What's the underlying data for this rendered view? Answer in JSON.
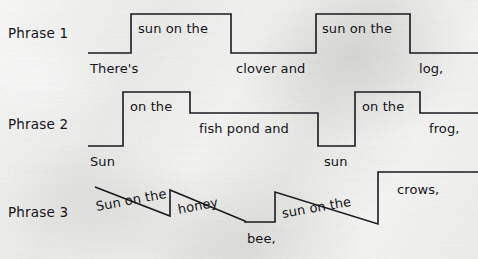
{
  "figure": {
    "type": "prosody-contour-diagram",
    "background_color": "#efefed",
    "line_color": "#1b1b20",
    "text_color": "#15151a"
  },
  "rows": [
    {
      "id": "phrase-1",
      "label": "Phrase 1",
      "label_x": 8,
      "label_y": 27,
      "contour": "M88,53 L131,53 L131,14 L231,14 L231,53 L316,53 L316,14 L410,14 L410,53 L478,53",
      "words": [
        {
          "text": "There's",
          "x": 90,
          "y": 62,
          "tilt": 0
        },
        {
          "text": "sun on the",
          "x": 138,
          "y": 22,
          "tilt": 0
        },
        {
          "text": "clover and",
          "x": 236,
          "y": 62,
          "tilt": 0
        },
        {
          "text": "sun on the",
          "x": 322,
          "y": 22,
          "tilt": 0
        },
        {
          "text": "log,",
          "x": 419,
          "y": 62,
          "tilt": 0
        }
      ]
    },
    {
      "id": "phrase-2",
      "label": "Phrase 2",
      "label_x": 8,
      "label_y": 118,
      "contour": "M88,146 L123,146 L123,92 L190,92 L190,113 L318,113 L318,146 L355,146 L355,92 L420,92 L420,113 L478,113",
      "words": [
        {
          "text": "Sun",
          "x": 90,
          "y": 155,
          "tilt": 0
        },
        {
          "text": "on the",
          "x": 130,
          "y": 100,
          "tilt": 0
        },
        {
          "text": "fish pond and",
          "x": 199,
          "y": 122,
          "tilt": 0
        },
        {
          "text": "sun",
          "x": 324,
          "y": 155,
          "tilt": 0
        },
        {
          "text": "on the",
          "x": 362,
          "y": 100,
          "tilt": 0
        },
        {
          "text": "frog,",
          "x": 429,
          "y": 122,
          "tilt": 0
        }
      ]
    },
    {
      "id": "phrase-3",
      "label": "Phrase 3",
      "label_x": 8,
      "label_y": 206,
      "contour": "M95,187 L170,216 L170,190 L245,221 L245,222 L275,222 L275,192 L378,224 L378,172 L478,172",
      "words": [
        {
          "text": "Sun on the",
          "x": 96,
          "y": 200,
          "tilt": -10.5
        },
        {
          "text": "honey",
          "x": 178,
          "y": 203,
          "tilt": -11
        },
        {
          "text": "bee,",
          "x": 247,
          "y": 232,
          "tilt": 0
        },
        {
          "text": "sun on the",
          "x": 282,
          "y": 207,
          "tilt": -10
        },
        {
          "text": "crows,",
          "x": 397,
          "y": 183,
          "tilt": 0
        }
      ]
    }
  ]
}
